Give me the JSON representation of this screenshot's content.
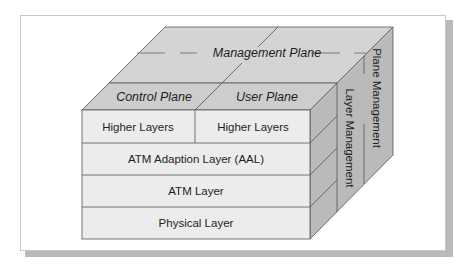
{
  "diagram": {
    "top_face": {
      "management_plane": "Management Plane",
      "control_plane": "Control Plane",
      "user_plane": "User Plane"
    },
    "front_face": {
      "rows": [
        {
          "cells": [
            "Higher Layers",
            "Higher Layers"
          ]
        },
        {
          "cells": [
            "ATM Adaption Layer (AAL)"
          ]
        },
        {
          "cells": [
            "ATM Layer"
          ]
        },
        {
          "cells": [
            "Physical Layer"
          ]
        }
      ]
    },
    "side_face": {
      "layer_management": "Layer Management",
      "plane_management": "Plane Management"
    },
    "colors": {
      "front": "#ececec",
      "top": "#d2d2d2",
      "side": "#b9b9b9",
      "line": "#555555",
      "card_shadow": "#b9b9b9"
    }
  }
}
